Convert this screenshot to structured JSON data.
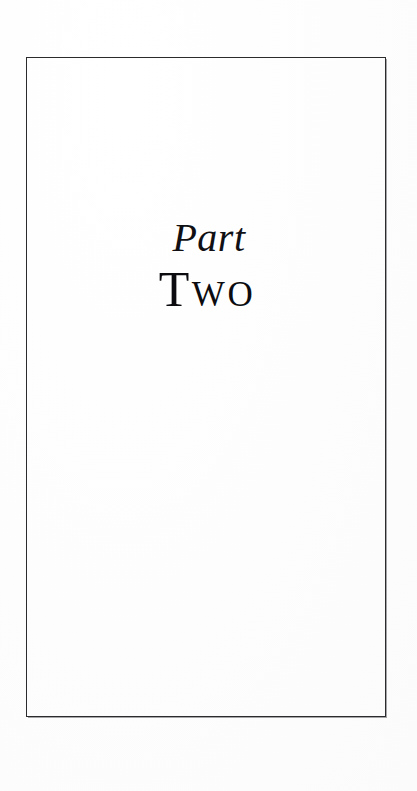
{
  "document": {
    "kind": "book-part-title-page",
    "page_background_color": "#fdfdfd",
    "ink_color": "#101014",
    "frame_color": "#2b2b2e"
  },
  "title": {
    "part_label": "Part",
    "part_number_word": "Two"
  },
  "frame": {
    "border_color": "#2b2b2e",
    "border_width_px": "1.4"
  },
  "body": {
    "content": ""
  }
}
